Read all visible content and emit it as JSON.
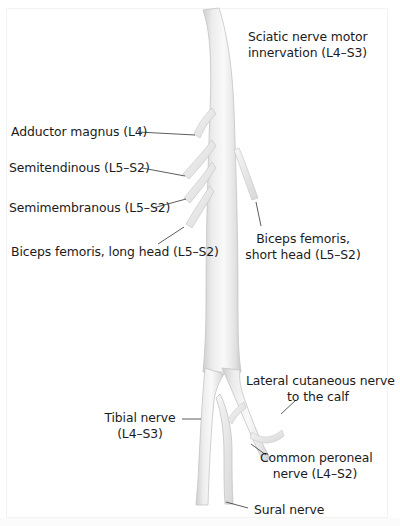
{
  "figure": {
    "title_label": {
      "line1": "Sciatic nerve motor",
      "line2": "innervation (L4–S3)"
    },
    "labels": {
      "adductor_magnus": "Adductor magnus (L4)",
      "semitendinosus": "Semitendinous (L5–S2)",
      "semimembranosus": "Semimembranous (L5–S2)",
      "biceps_long": "Biceps femoris, long head (L5–S2)",
      "biceps_short_line1": "Biceps femoris,",
      "biceps_short_line2": "short head (L5–S2)",
      "lateral_cutaneous_line1": "Lateral cutaneous nerve",
      "lateral_cutaneous_line2": "to the calf",
      "tibial_line1": "Tibial nerve",
      "tibial_line2": "(L4–S3)",
      "common_peroneal_line1": "Common peroneal",
      "common_peroneal_line2": "nerve (L4–S2)",
      "sural": "Sural nerve"
    },
    "colors": {
      "background": "#ffffff",
      "nerve_fill": "#ececec",
      "nerve_shade": "#d2d2d2",
      "nerve_highlight": "#f8f8f8",
      "leader_line": "#333333",
      "text": "#1b1b1b"
    }
  }
}
